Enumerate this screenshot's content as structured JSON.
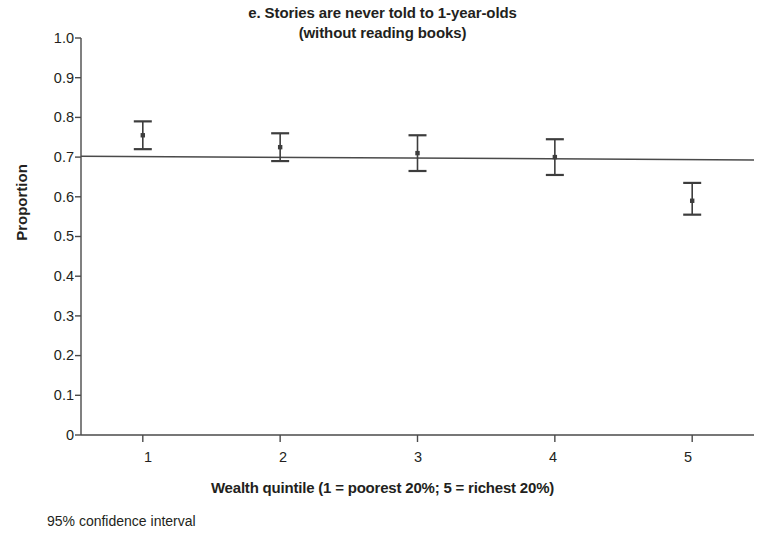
{
  "chart_data": {
    "type": "scatter",
    "title": "e. Stories are never told to 1-year-olds",
    "subtitle": "(without reading books)",
    "xlabel": "Wealth quintile (1 = poorest 20%; 5 = richest 20%)",
    "ylabel": "Proportion",
    "footnote": "95% confidence interval",
    "categories": [
      "1",
      "2",
      "3",
      "4",
      "5"
    ],
    "x": [
      1,
      2,
      3,
      4,
      5
    ],
    "values": [
      0.755,
      0.725,
      0.71,
      0.7,
      0.59
    ],
    "ci_low": [
      0.72,
      0.69,
      0.665,
      0.655,
      0.555
    ],
    "ci_high": [
      0.79,
      0.76,
      0.755,
      0.745,
      0.635
    ],
    "error_bars": "95% confidence interval",
    "trendline": {
      "x_start": 0.55,
      "x_end": 5.45,
      "y_start": 0.702,
      "y_end": 0.693
    },
    "ylim": [
      0,
      1.0
    ],
    "xlim": [
      0.55,
      5.45
    ],
    "ytick_labels": [
      "1.0",
      "0.9",
      "0.8",
      "0.7",
      "0.6",
      "0.5",
      "0.4",
      "0.3",
      "0.2",
      "0.1",
      "0"
    ],
    "ytick_values": [
      1.0,
      0.9,
      0.8,
      0.7,
      0.6,
      0.5,
      0.4,
      0.3,
      0.2,
      0.1,
      0
    ],
    "xtick_labels": [
      "1",
      "2",
      "3",
      "4",
      "5"
    ],
    "grid": false,
    "legend": null,
    "series_color": "#3d3d3d",
    "axis_color": "#4a4a4a"
  },
  "yticks": [
    {
      "label": "1.0"
    },
    {
      "label": "0.9"
    },
    {
      "label": "0.8"
    },
    {
      "label": "0.7"
    },
    {
      "label": "0.6"
    },
    {
      "label": "0.5"
    },
    {
      "label": "0.4"
    },
    {
      "label": "0.3"
    },
    {
      "label": "0.2"
    },
    {
      "label": "0.1"
    },
    {
      "label": "0"
    }
  ],
  "xticks": [
    {
      "label": "1"
    },
    {
      "label": "2"
    },
    {
      "label": "3"
    },
    {
      "label": "4"
    },
    {
      "label": "5"
    }
  ]
}
